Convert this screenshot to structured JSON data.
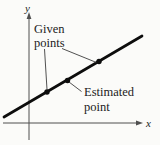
{
  "diagram": {
    "x_axis_label": "x",
    "y_axis_label": "y",
    "labels": {
      "given_line1": "Given",
      "given_line2": "points",
      "estimated_line1": "Estimated",
      "estimated_line2": "point"
    },
    "line": {
      "x1": 4,
      "y1": 117,
      "x2": 142,
      "y2": 36
    },
    "points": [
      {
        "name": "given-point-1",
        "x": 47,
        "y": 92
      },
      {
        "name": "estimated-point",
        "x": 67.5,
        "y": 80.5
      },
      {
        "name": "given-point-2",
        "x": 99,
        "y": 61.5
      }
    ],
    "leaders": [
      {
        "name": "leader-given-left",
        "x1": 44.5,
        "y1": 49,
        "x2": 47,
        "y2": 89.5
      },
      {
        "name": "leader-given-right",
        "x1": 62,
        "y1": 48.5,
        "x2": 96.5,
        "y2": 62.5
      },
      {
        "name": "leader-estimated",
        "x1": 69,
        "y1": 82,
        "x2": 81.5,
        "y2": 91.5
      }
    ],
    "colors": {
      "background": "#fbfbf9",
      "line": "#0d0d0d",
      "point": "#0d0d0d",
      "axis": "#4f4f4f",
      "leader": "#3d3d3d",
      "text": "#1c1c1c"
    }
  }
}
